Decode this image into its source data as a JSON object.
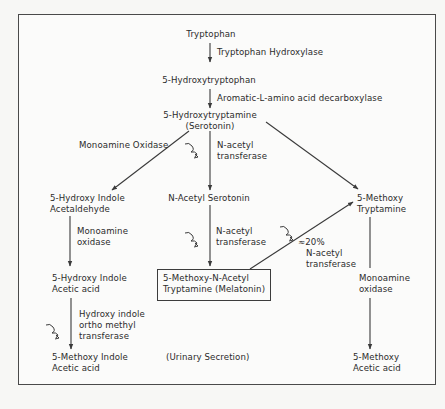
{
  "diagram": {
    "type": "biochemical-pathway",
    "nodes": {
      "tryptophan": "Tryptophan",
      "hydroxytryptophan": "5-Hydroxytryptophan",
      "serotonin": {
        "line1": "5-Hydroxytryptamine",
        "line2": "(Serotonin)"
      },
      "hydroxy_indole_acetaldehyde": {
        "line1": "5-Hydroxy Indole",
        "line2": "Acetaldehyde"
      },
      "n_acetyl_serotonin": "N-Acetyl Serotonin",
      "methoxy_tryptamine": {
        "line1": "5-Methoxy",
        "line2": "Tryptamine"
      },
      "hydroxy_indole_acetic_acid": {
        "line1": "5-Hydroxy Indole",
        "line2": "Acetic acid"
      },
      "melatonin": {
        "line1": "5-Methoxy-N-Acetyl",
        "line2": "Tryptamine (Melatonin)"
      },
      "methoxy_indole_acetic_acid": {
        "line1": "5-Methoxy Indole",
        "line2": "Acetic acid"
      },
      "urinary_secretion": "(Urinary Secretion)",
      "methoxy_acetic_acid": {
        "line1": "5-Methoxy",
        "line2": "Acetic acid"
      }
    },
    "enzymes": {
      "tryptophan_hydroxylase": "Tryptophan Hydroxylase",
      "aromatic_decarboxylase": "Aromatic-L-amino acid decarboxylase",
      "monoamine_oxidase_upper": "Monoamine Oxidase",
      "n_acetyl_transferase_upper": {
        "line1": "N-acetyl",
        "line2": "transferase"
      },
      "monoamine_oxidase_left": {
        "line1": "Monoamine",
        "line2": "oxidase"
      },
      "n_acetyl_transferase_middle": {
        "line1": "N-acetyl",
        "line2": "transferase"
      },
      "n_acetyl_transferase_diag": {
        "pct": "≈20%",
        "line1": "N-acetyl",
        "line2": "transferase"
      },
      "hiomt": {
        "line1": "Hydroxy indole",
        "line2": "ortho methyl",
        "line3": "transferase"
      },
      "monoamine_oxidase_right": {
        "line1": "Monoamine",
        "line2": "oxidase"
      }
    },
    "edges": [
      {
        "from": "Tryptophan",
        "to": "5-Hydroxytryptophan",
        "label": "Tryptophan Hydroxylase"
      },
      {
        "from": "5-Hydroxytryptophan",
        "to": "5-Hydroxytryptamine",
        "label": "Aromatic-L-amino acid decarboxylase"
      },
      {
        "from": "5-Hydroxytryptamine",
        "to": "5-Hydroxy Indole Acetaldehyde",
        "label": "Monoamine Oxidase"
      },
      {
        "from": "5-Hydroxytryptamine",
        "to": "N-Acetyl Serotonin",
        "label": "N-acetyl transferase"
      },
      {
        "from": "5-Hydroxytryptamine",
        "to": "5-Methoxy Tryptamine",
        "label": ""
      },
      {
        "from": "5-Hydroxy Indole Acetaldehyde",
        "to": "5-Hydroxy Indole Acetic acid",
        "label": "Monoamine oxidase"
      },
      {
        "from": "N-Acetyl Serotonin",
        "to": "5-Methoxy-N-Acetyl Tryptamine (Melatonin)",
        "label": "N-acetyl transferase"
      },
      {
        "from": "5-Methoxy-N-Acetyl Tryptamine (Melatonin)",
        "to": "5-Methoxy Tryptamine",
        "label": "≈20% N-acetyl transferase"
      },
      {
        "from": "5-Hydroxy Indole Acetic acid",
        "to": "5-Methoxy Indole Acetic acid",
        "label": "Hydroxy indole ortho methyl transferase"
      },
      {
        "from": "5-Methoxy Tryptamine",
        "to": "5-Methoxy Acetic acid",
        "label": "Monoamine oxidase"
      }
    ],
    "colors": {
      "line": "#3a3a3a",
      "text": "#2b2b2b",
      "background": "#fbfbfa"
    }
  }
}
